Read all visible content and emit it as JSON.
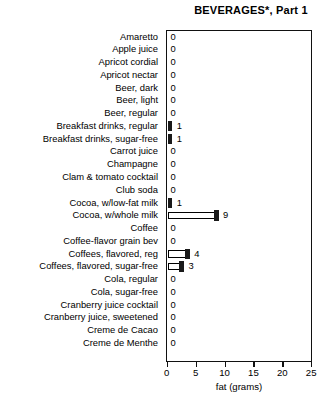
{
  "chart_data": {
    "type": "bar",
    "orientation": "horizontal",
    "title": "BEVERAGES*, Part 1",
    "xlabel": "fat (grams)",
    "ylabel": "",
    "xlim": [
      0,
      25
    ],
    "xticks": [
      0,
      5,
      10,
      15,
      20,
      25
    ],
    "grid": false,
    "legend": null,
    "categories": [
      "Amaretto",
      "Apple juice",
      "Apricot cordial",
      "Apricot nectar",
      "Beer, dark",
      "Beer, light",
      "Beer, regular",
      "Breakfast drinks, regular",
      "Breakfast drinks, sugar-free",
      "Carrot juice",
      "Champagne",
      "Clam & tomato cocktail",
      "Club soda",
      "Cocoa, w/low-fat milk",
      "Cocoa, w/whole milk",
      "Coffee",
      "Coffee-flavor grain bev",
      "Coffees, flavored, reg",
      "Coffees, flavored, sugar-free",
      "Cola, regular",
      "Cola, sugar-free",
      "Cranberry juice cocktail",
      "Cranberry juice, sweetened",
      "Creme de Cacao",
      "Creme de Menthe"
    ],
    "values": [
      0,
      0,
      0,
      0,
      0,
      0,
      0,
      1,
      1,
      0,
      0,
      0,
      0,
      1,
      9,
      0,
      0,
      4,
      3,
      0,
      0,
      0,
      0,
      0,
      0
    ],
    "value_labels": [
      "0",
      "0",
      "0",
      "0",
      "0",
      "0",
      "0",
      "1",
      "1",
      "0",
      "0",
      "0",
      "0",
      "1",
      "9",
      "0",
      "0",
      "4",
      "3",
      "0",
      "0",
      "0",
      "0",
      "0",
      "0"
    ],
    "colors": {
      "bar_fill": "#ffffff",
      "bar_outline": "#000000",
      "bar_cap": "#1a1a1a",
      "frame": "#111111",
      "text": "#000000",
      "background": "#ffffff"
    }
  },
  "footnote": "*"
}
